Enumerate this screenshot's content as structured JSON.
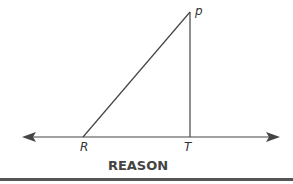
{
  "diagram": {
    "points": [
      {
        "label": "P",
        "x": 190,
        "y": 12
      },
      {
        "label": "R",
        "x": 83,
        "y": 137
      },
      {
        "label": "T",
        "x": 190,
        "y": 137
      }
    ],
    "segments": [
      "RP",
      "PT"
    ],
    "line": {
      "through": [
        "R",
        "T"
      ],
      "arrows": "both"
    },
    "labels": {
      "p": "p",
      "r": "R",
      "t": "T"
    }
  },
  "footer": {
    "heading": "REASON"
  },
  "colors": {
    "stroke": "#444444",
    "rule": "#555555"
  }
}
